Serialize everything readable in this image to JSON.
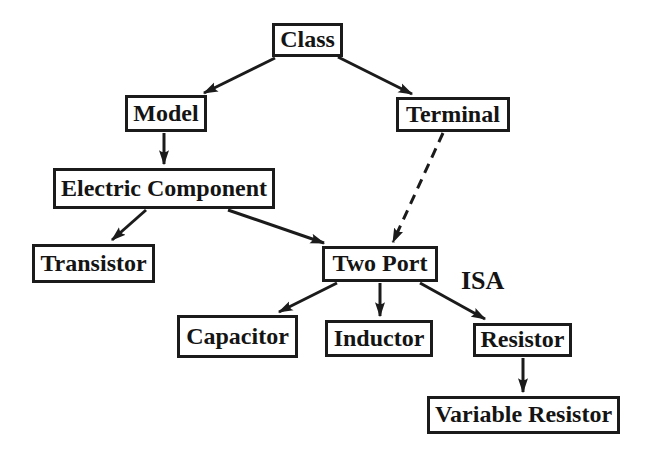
{
  "figure": {
    "background": "#ffffff",
    "ink": "#1b1b1b"
  },
  "nodes": [
    {
      "id": "class",
      "label": "Class",
      "x": 272,
      "y": 23,
      "w": 71,
      "h": 34
    },
    {
      "id": "model",
      "label": "Model",
      "x": 125,
      "y": 95,
      "w": 82,
      "h": 37
    },
    {
      "id": "terminal",
      "label": "Terminal",
      "x": 396,
      "y": 97,
      "w": 114,
      "h": 35
    },
    {
      "id": "electric-component",
      "label": "Electric Component",
      "x": 53,
      "y": 168,
      "w": 222,
      "h": 41
    },
    {
      "id": "transistor",
      "label": "Transistor",
      "x": 32,
      "y": 244,
      "w": 123,
      "h": 39
    },
    {
      "id": "two-port",
      "label": "Two Port",
      "x": 322,
      "y": 246,
      "w": 116,
      "h": 36
    },
    {
      "id": "capacitor",
      "label": "Capacitor",
      "x": 177,
      "y": 315,
      "w": 121,
      "h": 43
    },
    {
      "id": "inductor",
      "label": "Inductor",
      "x": 325,
      "y": 320,
      "w": 108,
      "h": 37
    },
    {
      "id": "resistor",
      "label": "Resistor",
      "x": 473,
      "y": 323,
      "w": 99,
      "h": 34
    },
    {
      "id": "variable-resistor",
      "label": "Variable Resistor",
      "x": 427,
      "y": 396,
      "w": 193,
      "h": 38
    }
  ],
  "edges": [
    {
      "from": "class",
      "to": "model",
      "style": "solid",
      "x1": 275,
      "y1": 58,
      "x2": 204,
      "y2": 93
    },
    {
      "from": "class",
      "to": "terminal",
      "style": "solid",
      "x1": 338,
      "y1": 57,
      "x2": 412,
      "y2": 94
    },
    {
      "from": "model",
      "to": "electric-component",
      "style": "solid",
      "x1": 164,
      "y1": 133,
      "x2": 164,
      "y2": 164
    },
    {
      "from": "electric-component",
      "to": "transistor",
      "style": "solid",
      "x1": 146,
      "y1": 210,
      "x2": 112,
      "y2": 240
    },
    {
      "from": "electric-component",
      "to": "two-port",
      "style": "solid",
      "x1": 228,
      "y1": 210,
      "x2": 324,
      "y2": 243
    },
    {
      "from": "terminal",
      "to": "two-port",
      "style": "dashed",
      "x1": 443,
      "y1": 133,
      "x2": 393,
      "y2": 242
    },
    {
      "from": "two-port",
      "to": "capacitor",
      "style": "solid",
      "x1": 337,
      "y1": 283,
      "x2": 279,
      "y2": 312
    },
    {
      "from": "two-port",
      "to": "inductor",
      "style": "solid",
      "x1": 380,
      "y1": 283,
      "x2": 380,
      "y2": 316
    },
    {
      "from": "two-port",
      "to": "resistor",
      "style": "solid",
      "x1": 420,
      "y1": 283,
      "x2": 485,
      "y2": 319
    },
    {
      "from": "resistor",
      "to": "variable-resistor",
      "style": "solid",
      "x1": 523,
      "y1": 358,
      "x2": 523,
      "y2": 392
    }
  ],
  "annotations": [
    {
      "id": "isa",
      "text": "ISA",
      "x": 461,
      "y": 268
    }
  ]
}
